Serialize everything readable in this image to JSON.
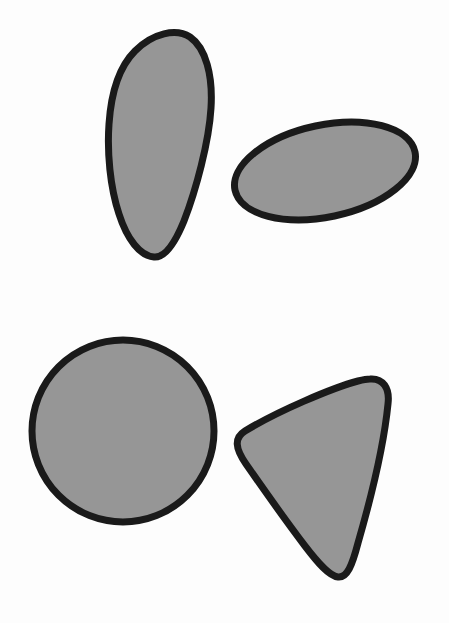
{
  "canvas": {
    "width": 449,
    "height": 623,
    "background_color": "#fdfdfd",
    "description": "Four solid gray shapes outlined in thick black, arranged in two rows on a plain white background"
  },
  "style": {
    "fill_color": "#969696",
    "stroke_color": "#1a1a1a",
    "stroke_width": 7
  },
  "shapes": [
    {
      "id": "tall-blob",
      "name": "tall-curved-blob",
      "label": "Tall curved blob",
      "position": "top-left",
      "bbox": {
        "x": 107,
        "y": 33,
        "width": 106,
        "height": 225
      },
      "center": {
        "x": 160,
        "y": 145
      },
      "fill": "#969696",
      "stroke": "#1a1a1a",
      "stroke_width": 7,
      "path": "M 190 37 C 206 48 213 76 211 108 C 209 142 196 190 184 221 C 175 243 165 258 154 257 C 140 256 127 239 119 214 C 110 187 107 152 109 124 C 111 94 119 67 135 51 C 153 33 176 28 190 37 Z"
    },
    {
      "id": "tilted-ellipse",
      "name": "tilted-ellipse",
      "label": "Tilted ellipse",
      "position": "top-right",
      "bbox": {
        "x": 234,
        "y": 126,
        "width": 181,
        "height": 90
      },
      "center": {
        "x": 325,
        "y": 171
      },
      "radius_x": 92,
      "radius_y": 46,
      "rotation_deg": -12,
      "fill": "#969696",
      "stroke": "#1a1a1a",
      "stroke_width": 7
    },
    {
      "id": "circle",
      "name": "circle",
      "label": "Circle",
      "position": "bottom-left",
      "bbox": {
        "x": 32,
        "y": 340,
        "width": 182,
        "height": 182
      },
      "center": {
        "x": 123,
        "y": 431
      },
      "radius": 91,
      "fill": "#969696",
      "stroke": "#1a1a1a",
      "stroke_width": 7
    },
    {
      "id": "rounded-triangle",
      "name": "rounded-triangle",
      "label": "Rounded triangle",
      "position": "bottom-right",
      "bbox": {
        "x": 235,
        "y": 378,
        "width": 155,
        "height": 200
      },
      "center": {
        "x": 320,
        "y": 470
      },
      "vertices": [
        {
          "x": 383,
          "y": 381
        },
        {
          "x": 238,
          "y": 450
        },
        {
          "x": 345,
          "y": 577
        }
      ],
      "corner_radius": 22,
      "fill": "#969696",
      "stroke": "#1a1a1a",
      "stroke_width": 7,
      "path": "M 370 379 C 383 378 390 388 388 404 C 384 444 371 498 358 543 C 352 566 347 578 338 577 C 329 576 318 563 305 546 C 286 521 262 487 246 464 C 235 448 234 438 245 431 C 278 411 332 388 358 381 C 362 380 366 379 370 379 Z"
    }
  ]
}
